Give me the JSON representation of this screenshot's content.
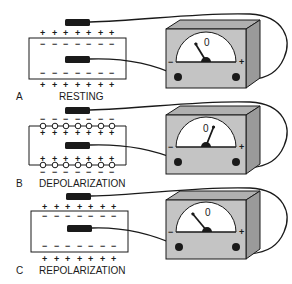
{
  "panels": [
    {
      "letter": "A",
      "caption": "RESTING",
      "outside_sign": "+",
      "inside_sign": "−",
      "needle": "left",
      "meter": {
        "zero": "0",
        "minus": "−",
        "plus": "+"
      }
    },
    {
      "letter": "B",
      "caption": "DEPOLARIZATION",
      "outside_sign": "−",
      "inside_sign": "+",
      "needle": "right",
      "meter": {
        "zero": "0",
        "minus": "−",
        "plus": "+"
      }
    },
    {
      "letter": "C",
      "caption": "REPOLARIZATION",
      "outside_sign": "+",
      "inside_sign": "−",
      "needle": "left",
      "meter": {
        "zero": "0",
        "minus": "−",
        "plus": "+"
      }
    }
  ],
  "colors": {
    "meter_front": "#c4c4c4",
    "meter_top": "#b0b0b0",
    "meter_side": "#9a9a9a",
    "ink": "#1a1a1a"
  }
}
